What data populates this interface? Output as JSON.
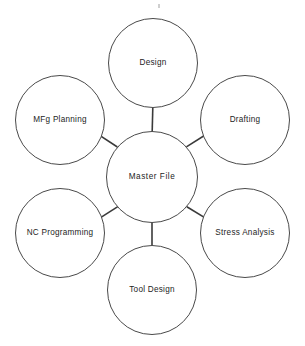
{
  "diagram": {
    "type": "hub-and-spoke",
    "title": "Master File",
    "background_color": "#ffffff",
    "stroke_color": "#4a4a4a",
    "connector_color": "#3a3a3a",
    "text_color": "#1d1d1d",
    "hub": {
      "label": "Master File",
      "cx": 152,
      "cy": 177,
      "r": 45.5
    },
    "nodes": [
      {
        "id": "design",
        "label": "Design",
        "cx": 153,
        "cy": 63,
        "r": 44.5,
        "angle_deg": 270
      },
      {
        "id": "drafting",
        "label": "Drafting",
        "cx": 245,
        "cy": 120,
        "r": 44.5,
        "angle_deg": 328
      },
      {
        "id": "stress-analysis",
        "label": "Stress Analysis",
        "cx": 245,
        "cy": 233,
        "r": 44.5,
        "angle_deg": 32
      },
      {
        "id": "tool-design",
        "label": "Tool Design",
        "cx": 152,
        "cy": 290,
        "r": 44.5,
        "angle_deg": 90
      },
      {
        "id": "nc-programming",
        "label": "NC Programming",
        "cx": 60,
        "cy": 233,
        "r": 44.5,
        "angle_deg": 148
      },
      {
        "id": "mfg-planning",
        "label": "MFg Planning",
        "cx": 60,
        "cy": 120,
        "r": 44.5,
        "angle_deg": 212
      }
    ],
    "connectors": [
      {
        "from": "hub",
        "to": "design",
        "x1": 152.2,
        "y1": 131.5,
        "x2": 152.8,
        "y2": 107.5
      },
      {
        "from": "hub",
        "to": "drafting",
        "x1": 186.4,
        "y1": 146.9,
        "x2": 207.2,
        "y2": 133.8
      },
      {
        "from": "hub",
        "to": "stress-analysis",
        "x1": 186.8,
        "y1": 206.8,
        "x2": 207.6,
        "y2": 219.4
      },
      {
        "from": "hub",
        "to": "tool-design",
        "x1": 152.0,
        "y1": 222.5,
        "x2": 152.0,
        "y2": 245.5
      },
      {
        "from": "hub",
        "to": "nc-programming",
        "x1": 117.8,
        "y1": 206.6,
        "x2": 97.4,
        "y2": 219.6
      },
      {
        "from": "hub",
        "to": "mfg-planning",
        "x1": 117.4,
        "y1": 147.0,
        "x2": 97.0,
        "y2": 133.6
      }
    ]
  }
}
